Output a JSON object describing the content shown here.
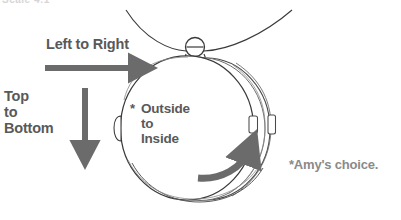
{
  "page": {
    "kind": "instructional-diagram",
    "background_color": "#ffffff"
  },
  "cropped_header": {
    "text": "Scale 4:1"
  },
  "labels": {
    "left_to_right": "Left to Right",
    "top_to_bottom_line1": "Top",
    "top_to_bottom_line2": "to",
    "top_to_bottom_line3": "Bottom",
    "outside_to_inside_marker": "*",
    "outside_to_inside_line1": "Outside",
    "outside_to_inside_line2": "to",
    "outside_to_inside_line3": "Inside",
    "amys_choice": "*Amy's choice."
  },
  "colors": {
    "text": "#595959",
    "muted_text": "#8a8a8a",
    "arrow": "#6b6b6b",
    "outline": "#3a3a3a",
    "faint_outline": "#8c8c8c",
    "background": "#ffffff"
  },
  "arrows": {
    "horizontal": {
      "name": "left-to-right-arrow",
      "direction": "right",
      "from_x": 45,
      "to_x": 152,
      "y": 68
    },
    "vertical": {
      "name": "top-to-bottom-arrow",
      "direction": "down",
      "x": 85,
      "from_y": 88,
      "to_y": 164
    },
    "curved": {
      "name": "outside-to-inside-curved-arrow",
      "direction": "counter-clockwise-sweep-up-right",
      "start": "lower-left of locket face",
      "end": "right clasp edge"
    }
  },
  "locket": {
    "name": "round-locket-pendant",
    "front_lid": {
      "cx": 188,
      "cy": 128,
      "rx": 66,
      "ry": 72
    },
    "back_shell": {
      "cx": 205,
      "cy": 128,
      "rx": 64,
      "ry": 71
    },
    "inner_shell": {
      "cx": 199,
      "cy": 128,
      "rx": 65,
      "ry": 71
    },
    "bail_ring": {
      "cx": 195,
      "cy": 47,
      "r": 9
    },
    "hinge_tab_left": {
      "x": 120,
      "y": 122
    },
    "clasp_tab_mid": {
      "x": 251,
      "y": 123
    },
    "clasp_tab_right": {
      "x": 271,
      "y": 122
    },
    "chain": {
      "left_x": 128,
      "right_x": 290,
      "sag_y": 50
    }
  }
}
